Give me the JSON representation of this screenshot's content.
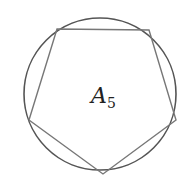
{
  "diagram": {
    "label": "A",
    "subscript": "5",
    "circle": {
      "cx": 100,
      "cy": 94,
      "r": 76,
      "stroke": "#555555"
    },
    "polygon": {
      "sides": 5,
      "stroke": "#777777",
      "points": "57,29 149,30 176,120 103,174 29,120"
    }
  }
}
